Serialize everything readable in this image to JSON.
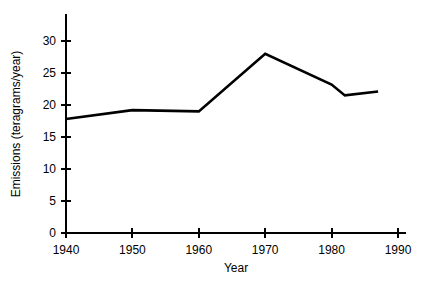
{
  "chart_data": {
    "type": "line",
    "title": "",
    "xlabel": "Year",
    "ylabel": "Emissions (teragrams/year)",
    "xlim": [
      1940,
      1990
    ],
    "ylim": [
      0,
      33
    ],
    "grid": false,
    "legend": null,
    "xticks": [
      1940,
      1950,
      1960,
      1970,
      1980,
      1990
    ],
    "xtick_labels": [
      "1940",
      "1950",
      "1960",
      "1970",
      "1980",
      "1990"
    ],
    "yticks": [
      0,
      5,
      10,
      15,
      20,
      25,
      30
    ],
    "ytick_labels": [
      "0",
      "5",
      "10",
      "15",
      "20",
      "25",
      "30"
    ],
    "series": [
      {
        "name": "Emissions",
        "color": "#000000",
        "linewidth": 2.6,
        "x": [
          1940,
          1950,
          1960,
          1970,
          1980,
          1982,
          1987
        ],
        "values": [
          17.8,
          19.2,
          19.0,
          28.0,
          23.2,
          21.5,
          22.1
        ]
      }
    ]
  },
  "axis": {
    "x_label": "Year",
    "y_label": "Emissions (teragrams/year)"
  }
}
